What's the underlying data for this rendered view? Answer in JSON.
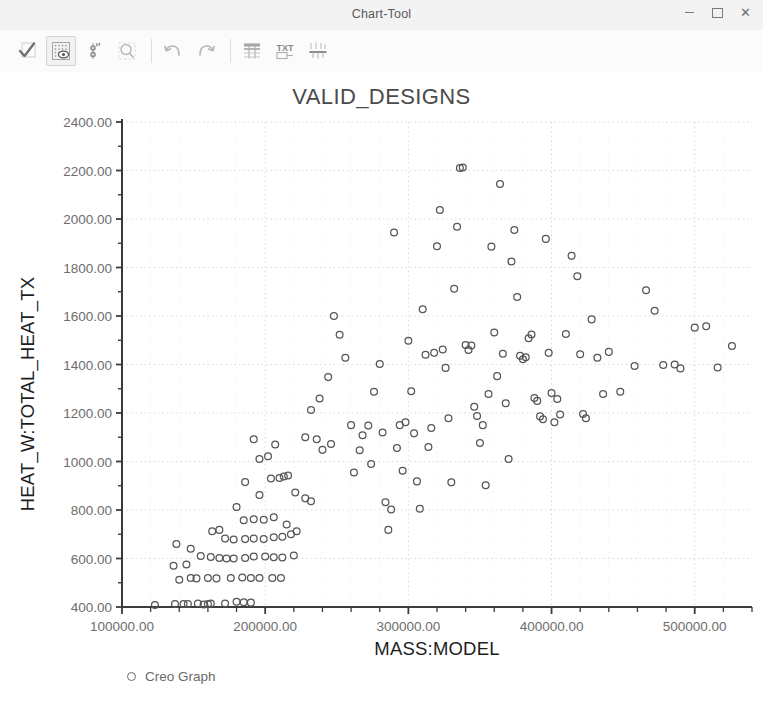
{
  "window": {
    "title": "Chart-Tool",
    "controls": [
      {
        "name": "minimize-button",
        "glyph": "minimize"
      },
      {
        "name": "maximize-button",
        "glyph": "maximize"
      },
      {
        "name": "close-button",
        "glyph": "X"
      }
    ]
  },
  "toolbar": {
    "items": [
      {
        "name": "accept-check-icon",
        "label": "Accept",
        "active": false
      },
      {
        "name": "grid-visibility-icon",
        "label": "Show Grid",
        "active": true
      },
      {
        "name": "axis-settings-icon",
        "label": "Axis Settings",
        "active": false
      },
      {
        "name": "zoom-magnifier-icon",
        "label": "Zoom",
        "active": false
      },
      {
        "name": "undo-icon",
        "label": "Undo",
        "active": false
      },
      {
        "name": "redo-icon",
        "label": "Redo",
        "active": false
      },
      {
        "name": "table-view-icon",
        "label": "Table View",
        "active": false
      },
      {
        "name": "text-label-icon",
        "label": "Text Label",
        "active": false
      },
      {
        "name": "axes-config-icon",
        "label": "Configure Axes",
        "active": false
      }
    ]
  },
  "colors": {
    "marker_stroke": "#555555",
    "axis": "#3c3c3c",
    "grid": "#d9d9d9",
    "title_text": "#4a4a4a",
    "tick_text": "#6d6d6d",
    "label_text": "#1e1e1e",
    "titlebar_bg": "#f3f3f3",
    "plot_bg": "#ffffff"
  },
  "chart_data": {
    "type": "scatter",
    "title": "VALID_DESIGNS",
    "xlabel": "MASS:MODEL",
    "ylabel": "HEAT_W:TOTAL_HEAT_TX",
    "xlim": [
      100000,
      540000
    ],
    "ylim": [
      400,
      2400
    ],
    "xticks": [
      100000,
      200000,
      300000,
      400000,
      500000
    ],
    "xtick_labels": [
      "100000.00",
      "200000.00",
      "300000.00",
      "400000.00",
      "500000.00"
    ],
    "x_minor_step": 20000,
    "yticks": [
      400,
      600,
      800,
      1000,
      1200,
      1400,
      1600,
      1800,
      2000,
      2200,
      2400
    ],
    "ytick_labels": [
      "400.00",
      "600.00",
      "800.00",
      "1000.00",
      "1200.00",
      "1400.00",
      "1600.00",
      "1800.00",
      "2000.00",
      "2200.00",
      "2400.00"
    ],
    "y_minor_step": 100,
    "grid": true,
    "grid_style": "dotted",
    "legend": {
      "position": "bottom-left",
      "entries": [
        {
          "label": "Creo Graph",
          "marker": "open-circle"
        }
      ]
    },
    "series": [
      {
        "name": "Creo Graph",
        "marker": "open-circle",
        "points": [
          [
            123000,
            408
          ],
          [
            137000,
            412
          ],
          [
            143000,
            412
          ],
          [
            146000,
            412
          ],
          [
            153000,
            414
          ],
          [
            157000,
            410
          ],
          [
            160000,
            412
          ],
          [
            162000,
            414
          ],
          [
            172000,
            414
          ],
          [
            180000,
            422
          ],
          [
            185000,
            420
          ],
          [
            190000,
            418
          ],
          [
            140000,
            512
          ],
          [
            148000,
            520
          ],
          [
            152000,
            518
          ],
          [
            160000,
            520
          ],
          [
            166000,
            518
          ],
          [
            176000,
            520
          ],
          [
            184000,
            522
          ],
          [
            190000,
            520
          ],
          [
            196000,
            520
          ],
          [
            205000,
            520
          ],
          [
            211000,
            520
          ],
          [
            136000,
            570
          ],
          [
            145000,
            575
          ],
          [
            138000,
            660
          ],
          [
            148000,
            640
          ],
          [
            155000,
            610
          ],
          [
            162000,
            606
          ],
          [
            168000,
            602
          ],
          [
            173000,
            600
          ],
          [
            178000,
            600
          ],
          [
            186000,
            602
          ],
          [
            192000,
            608
          ],
          [
            200000,
            608
          ],
          [
            206000,
            605
          ],
          [
            212000,
            604
          ],
          [
            220000,
            612
          ],
          [
            172000,
            682
          ],
          [
            178000,
            678
          ],
          [
            186000,
            680
          ],
          [
            192000,
            682
          ],
          [
            199000,
            680
          ],
          [
            206000,
            688
          ],
          [
            212000,
            690
          ],
          [
            218000,
            700
          ],
          [
            163000,
            712
          ],
          [
            168000,
            718
          ],
          [
            185000,
            758
          ],
          [
            192000,
            762
          ],
          [
            199000,
            760
          ],
          [
            206000,
            770
          ],
          [
            215000,
            740
          ],
          [
            222000,
            712
          ],
          [
            180000,
            812
          ],
          [
            196000,
            862
          ],
          [
            186000,
            915
          ],
          [
            204000,
            930
          ],
          [
            210000,
            932
          ],
          [
            213000,
            938
          ],
          [
            216000,
            942
          ],
          [
            221000,
            872
          ],
          [
            228000,
            848
          ],
          [
            232000,
            836
          ],
          [
            196000,
            1010
          ],
          [
            202000,
            1022
          ],
          [
            207000,
            1070
          ],
          [
            192000,
            1092
          ],
          [
            228000,
            1100
          ],
          [
            232000,
            1212
          ],
          [
            238000,
            1260
          ],
          [
            244000,
            1348
          ],
          [
            236000,
            1092
          ],
          [
            240000,
            1048
          ],
          [
            246000,
            1072
          ],
          [
            248000,
            1600
          ],
          [
            252000,
            1523
          ],
          [
            256000,
            1428
          ],
          [
            260000,
            1150
          ],
          [
            262000,
            955
          ],
          [
            266000,
            1046
          ],
          [
            268000,
            1108
          ],
          [
            272000,
            1148
          ],
          [
            274000,
            990
          ],
          [
            276000,
            1288
          ],
          [
            280000,
            1402
          ],
          [
            282000,
            1120
          ],
          [
            284000,
            832
          ],
          [
            286000,
            718
          ],
          [
            288000,
            802
          ],
          [
            290000,
            1944
          ],
          [
            292000,
            1056
          ],
          [
            294000,
            1150
          ],
          [
            296000,
            962
          ],
          [
            298000,
            1162
          ],
          [
            300000,
            1498
          ],
          [
            302000,
            1290
          ],
          [
            304000,
            1116
          ],
          [
            306000,
            918
          ],
          [
            308000,
            805
          ],
          [
            310000,
            1628
          ],
          [
            312000,
            1440
          ],
          [
            314000,
            1060
          ],
          [
            316000,
            1138
          ],
          [
            318000,
            1448
          ],
          [
            320000,
            1888
          ],
          [
            322000,
            2037
          ],
          [
            324000,
            1462
          ],
          [
            326000,
            1386
          ],
          [
            328000,
            1178
          ],
          [
            330000,
            914
          ],
          [
            332000,
            1712
          ],
          [
            334000,
            1968
          ],
          [
            336000,
            2210
          ],
          [
            338000,
            2212
          ],
          [
            340000,
            1480
          ],
          [
            342000,
            1460
          ],
          [
            344000,
            1478
          ],
          [
            346000,
            1226
          ],
          [
            348000,
            1188
          ],
          [
            350000,
            1076
          ],
          [
            352000,
            1150
          ],
          [
            354000,
            902
          ],
          [
            356000,
            1278
          ],
          [
            358000,
            1886
          ],
          [
            360000,
            1532
          ],
          [
            362000,
            1352
          ],
          [
            364000,
            2144
          ],
          [
            366000,
            1444
          ],
          [
            368000,
            1240
          ],
          [
            370000,
            1010
          ],
          [
            372000,
            1825
          ],
          [
            374000,
            1955
          ],
          [
            376000,
            1678
          ],
          [
            378000,
            1436
          ],
          [
            380000,
            1422
          ],
          [
            382000,
            1430
          ],
          [
            384000,
            1508
          ],
          [
            386000,
            1524
          ],
          [
            388000,
            1262
          ],
          [
            390000,
            1250
          ],
          [
            392000,
            1186
          ],
          [
            394000,
            1174
          ],
          [
            396000,
            1918
          ],
          [
            398000,
            1448
          ],
          [
            400000,
            1282
          ],
          [
            402000,
            1162
          ],
          [
            404000,
            1258
          ],
          [
            406000,
            1194
          ],
          [
            410000,
            1526
          ],
          [
            414000,
            1848
          ],
          [
            418000,
            1764
          ],
          [
            420000,
            1442
          ],
          [
            422000,
            1196
          ],
          [
            424000,
            1178
          ],
          [
            428000,
            1586
          ],
          [
            432000,
            1428
          ],
          [
            436000,
            1278
          ],
          [
            440000,
            1452
          ],
          [
            448000,
            1288
          ],
          [
            458000,
            1394
          ],
          [
            466000,
            1706
          ],
          [
            472000,
            1622
          ],
          [
            478000,
            1398
          ],
          [
            486000,
            1400
          ],
          [
            490000,
            1384
          ],
          [
            500000,
            1552
          ],
          [
            508000,
            1558
          ],
          [
            516000,
            1388
          ],
          [
            526000,
            1476
          ]
        ]
      }
    ]
  }
}
